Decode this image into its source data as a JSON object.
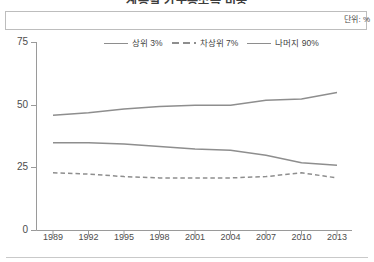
{
  "figure": {
    "title": "계층별 가구총소득 비중",
    "unit_label": "단위: %",
    "bottom_rule": true
  },
  "legend": {
    "position": "top-center",
    "items": [
      {
        "label": "상위 3%",
        "style": "solid",
        "color": "#8e8e8e"
      },
      {
        "label": "차상위 7%",
        "style": "dashed",
        "color": "#8e8e8e"
      },
      {
        "label": "나머지 90%",
        "style": "solid",
        "color": "#8e8e8e"
      }
    ]
  },
  "axes": {
    "y_ticks": [
      "0",
      "25",
      "50",
      "75"
    ],
    "x_ticks": [
      "1989",
      "1992",
      "1995",
      "1998",
      "2001",
      "2004",
      "2007",
      "2010",
      "2013"
    ]
  },
  "chart_data": {
    "type": "line",
    "title": "계층별 가구총소득 비중",
    "xlabel": "",
    "ylabel": "",
    "unit": "%",
    "grid": false,
    "legend_position": "top-center",
    "ylim": [
      0,
      75
    ],
    "yticks": [
      0,
      25,
      50,
      75
    ],
    "x": [
      1989,
      1992,
      1995,
      1998,
      2001,
      2004,
      2007,
      2010,
      2013
    ],
    "series": [
      {
        "name": "상위 3%",
        "style": "solid",
        "color": "#8e8e8e",
        "values": [
          46,
          47,
          48.5,
          49.5,
          50,
          50,
          52,
          52.5,
          55
        ]
      },
      {
        "name": "차상위 7%",
        "style": "dashed",
        "color": "#8e8e8e",
        "values": [
          23,
          22.5,
          21.5,
          21,
          21,
          21,
          21.5,
          23,
          21
        ]
      },
      {
        "name": "나머지 90%",
        "style": "solid",
        "color": "#8e8e8e",
        "values": [
          35,
          35,
          34.5,
          33.5,
          32.5,
          32,
          30,
          27,
          26
        ]
      }
    ]
  }
}
